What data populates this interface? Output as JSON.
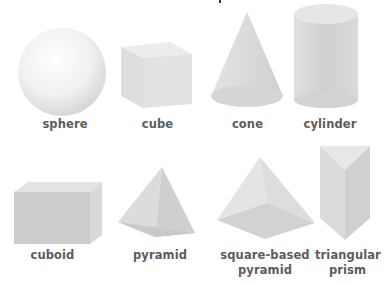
{
  "colors": {
    "label": "#5c5c5c",
    "shape_light": "#eeeeee",
    "shape_mid": "#d6d6d6",
    "shape_dark": "#bdbdbd"
  },
  "shapes": [
    {
      "id": "sphere",
      "label": "sphere"
    },
    {
      "id": "cube",
      "label": "cube"
    },
    {
      "id": "cone",
      "label": "cone"
    },
    {
      "id": "cylinder",
      "label": "cylinder"
    },
    {
      "id": "cuboid",
      "label": "cuboid"
    },
    {
      "id": "pyramid",
      "label": "pyramid"
    },
    {
      "id": "square-based-pyramid",
      "label_line1": "square-based",
      "label_line2": "pyramid"
    },
    {
      "id": "triangular-prism",
      "label_line1": "triangular",
      "label_line2": "prism"
    }
  ]
}
